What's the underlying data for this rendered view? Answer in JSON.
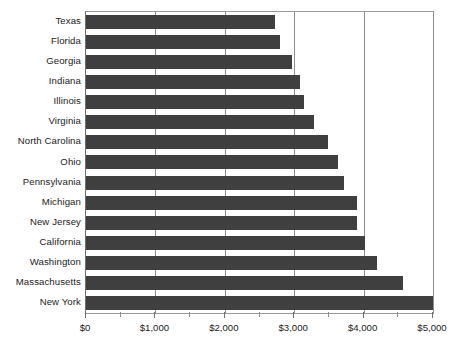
{
  "chart_data": {
    "type": "bar",
    "orientation": "horizontal",
    "title": "",
    "subtitle": "",
    "xlabel": "",
    "ylabel": "",
    "xlim": [
      0,
      5000
    ],
    "grid": true,
    "legend": false,
    "legend_position": "none",
    "bar_color": "#3f3f3f",
    "gridline_color": "#8e8e8e",
    "background_color": "#ffffff",
    "x_ticks": [
      {
        "value": 0,
        "label": "$0",
        "major": true
      },
      {
        "value": 500,
        "label": "",
        "major": false
      },
      {
        "value": 1000,
        "label": "$1,000",
        "major": true
      },
      {
        "value": 1500,
        "label": "",
        "major": false
      },
      {
        "value": 2000,
        "label": "$2,000",
        "major": true
      },
      {
        "value": 2500,
        "label": "",
        "major": false
      },
      {
        "value": 3000,
        "label": "$3,000",
        "major": true
      },
      {
        "value": 3500,
        "label": "",
        "major": false
      },
      {
        "value": 4000,
        "label": "$4,000",
        "major": true
      },
      {
        "value": 4500,
        "label": "",
        "major": false
      },
      {
        "value": 5000,
        "label": "$5,000",
        "major": true
      }
    ],
    "categories": [
      "Texas",
      "Florida",
      "Georgia",
      "Indiana",
      "Illinois",
      "Virginia",
      "North Carolina",
      "Ohio",
      "Pennsylvania",
      "Michigan",
      "New Jersey",
      "California",
      "Washington",
      "Massachusetts",
      "New York"
    ],
    "values": [
      2720,
      2800,
      2970,
      3090,
      3140,
      3290,
      3490,
      3630,
      3720,
      3900,
      3910,
      4020,
      4200,
      4570,
      5000
    ]
  }
}
